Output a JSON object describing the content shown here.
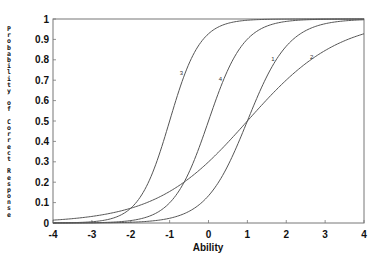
{
  "chart_data": {
    "type": "line",
    "title": "",
    "xlabel": "Ability",
    "ylabel": "Probability of Correct Response",
    "xlim": [
      -4,
      4
    ],
    "ylim": [
      0,
      1
    ],
    "xticks": [
      -4,
      -3,
      -2,
      -1,
      0,
      1,
      2,
      3,
      4
    ],
    "xtick_labels": [
      "-4",
      "-3",
      "-2",
      "-1",
      "0",
      "1",
      "2",
      "3",
      "4"
    ],
    "yticks": [
      0,
      0.1,
      0.2,
      0.3,
      0.4,
      0.5,
      0.6,
      0.7,
      0.8,
      0.9,
      1
    ],
    "ytick_labels": [
      "0",
      "0.1",
      "0.2",
      "0.3",
      "0.4",
      "0.5",
      "0.6",
      "0.7",
      "0.8",
      "0.9",
      "1"
    ],
    "grid": false,
    "legend": "inline curve labels",
    "model": "2PL logistic item characteristic curves: P = 1/(1+exp(-1.7a(theta-b)))",
    "series": [
      {
        "name": "1",
        "a": 1.1,
        "b": 1.0,
        "label_at_x": 1.75,
        "x": [
          -4,
          -3,
          -2,
          -1,
          0,
          1,
          2,
          3,
          4
        ],
        "values": [
          0.0001,
          0.0006,
          0.0036,
          0.023,
          0.13,
          0.5,
          0.87,
          0.98,
          0.997
        ]
      },
      {
        "name": "2",
        "a": 0.5,
        "b": 1.0,
        "label_at_x": 2.75,
        "x": [
          -4,
          -3,
          -2,
          -1,
          0,
          1,
          2,
          3,
          4
        ],
        "values": [
          0.014,
          0.032,
          0.072,
          0.154,
          0.3,
          0.5,
          0.7,
          0.846,
          0.928
        ]
      },
      {
        "name": "3",
        "a": 1.5,
        "b": -1.0,
        "label_at_x": -0.6,
        "x": [
          -4,
          -3,
          -2,
          -1,
          0,
          1,
          2,
          3,
          4
        ],
        "values": [
          0.0005,
          0.006,
          0.072,
          0.5,
          0.928,
          0.994,
          0.9995,
          1.0,
          1.0
        ]
      },
      {
        "name": "4",
        "a": 1.3,
        "b": 0.0,
        "label_at_x": 0.4,
        "x": [
          -4,
          -3,
          -2,
          -1,
          0,
          1,
          2,
          3,
          4
        ],
        "values": [
          0.0001,
          0.0014,
          0.012,
          0.099,
          0.5,
          0.901,
          0.988,
          0.9986,
          0.9998
        ]
      }
    ]
  },
  "axes": {
    "ylabel_letters": [
      "P",
      "r",
      "o",
      "b",
      "a",
      "b",
      "i",
      "l",
      "i",
      "t",
      "y",
      " ",
      "o",
      "f",
      " ",
      "C",
      "o",
      "r",
      "r",
      "e",
      "c",
      "t",
      " ",
      "R",
      "e",
      "s",
      "p",
      "o",
      "n",
      "s",
      "e"
    ]
  }
}
